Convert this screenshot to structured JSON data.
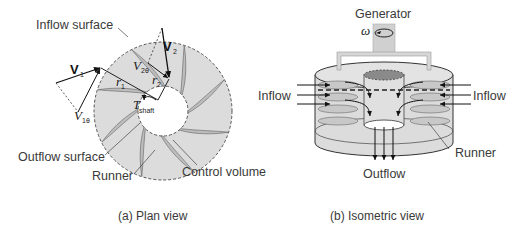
{
  "figure": {
    "panel_a": {
      "caption": "(a) Plan view",
      "labels": {
        "inflow_surface": "Inflow surface",
        "outflow_surface": "Outflow surface",
        "runner": "Runner",
        "control_volume": "Control volume"
      },
      "symbols": {
        "v1": "V",
        "v1_sub": "1",
        "v2": "V",
        "v2_sub": "2",
        "v1theta": "V",
        "v1theta_sub": "1θ",
        "v2theta": "V",
        "v2theta_sub": "2θ",
        "r1": "r",
        "r1_sub": "1",
        "r2": "r",
        "r2_sub": "2",
        "torque": "T",
        "torque_sub": "shaft"
      }
    },
    "panel_b": {
      "caption": "(b) Isometric view",
      "labels": {
        "generator": "Generator",
        "omega": "ω",
        "inflow_left": "Inflow",
        "inflow_right": "Inflow",
        "outflow": "Outflow",
        "runner": "Runner"
      }
    },
    "colors": {
      "fill_gray": "#dcdcdc",
      "blade_fill": "#bdbdbd",
      "dark_fill": "#8a8a8a",
      "line": "#222222"
    }
  }
}
